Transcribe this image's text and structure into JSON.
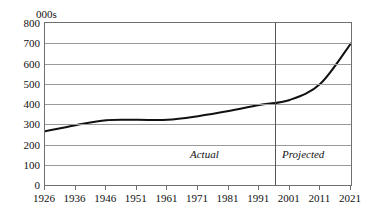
{
  "chart_data": {
    "type": "line",
    "title": "",
    "subtitle": "",
    "unit_label": "000s",
    "xlabel": "",
    "ylabel": "",
    "ylim": [
      0,
      800
    ],
    "ytick_values": [
      800,
      700,
      600,
      500,
      400,
      300,
      200,
      100,
      0
    ],
    "ytick_labels": [
      "800",
      "700",
      "600",
      "500",
      "400",
      "300",
      "200",
      "100",
      "0"
    ],
    "grid": true,
    "legend": "none",
    "categories": [
      "1926",
      "1936",
      "1946",
      "1951",
      "1961",
      "1971",
      "1981",
      "1991",
      "2001",
      "2011",
      "2021"
    ],
    "series": [
      {
        "name": "Total",
        "values": [
          265,
          295,
          320,
          322,
          322,
          340,
          365,
          395,
          420,
          500,
          700
        ]
      }
    ],
    "annotations": [
      {
        "text": "Actual",
        "style": "italic",
        "region": "left-of-divider"
      },
      {
        "text": "Projected",
        "style": "italic",
        "region": "right-of-divider"
      }
    ],
    "divider": {
      "label": "actual-projected-divider",
      "between": [
        "1991",
        "2001"
      ]
    },
    "colors": {
      "line": "#111111",
      "grid": "#9a9a9a",
      "frame": "#6f6f6f",
      "background": "#ffffff",
      "text": "#111111"
    }
  }
}
